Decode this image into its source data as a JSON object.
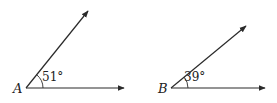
{
  "diagram": {
    "type": "angles",
    "angles": [
      {
        "vertex_label": "A",
        "measure_label": "51°",
        "measure_deg": 51,
        "vertex": [
          26,
          88
        ],
        "ray_ends": [
          [
            88,
            11
          ],
          [
            124,
            88
          ]
        ],
        "label_pos": [
          13,
          93
        ],
        "measure_pos": [
          42,
          81
        ],
        "arc_radius": 17
      },
      {
        "vertex_label": "B",
        "measure_label": "39°",
        "measure_deg": 39,
        "vertex": [
          171,
          88
        ],
        "ray_ends": [
          [
            246,
            26
          ],
          [
            265,
            88
          ]
        ],
        "label_pos": [
          158,
          93
        ],
        "measure_pos": [
          184,
          81
        ],
        "arc_radius": 17
      }
    ],
    "colors": {
      "stroke": "#2a2a2a",
      "text": "#222222",
      "background": "#ffffff"
    }
  }
}
